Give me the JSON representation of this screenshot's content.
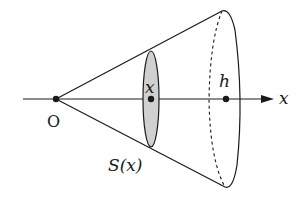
{
  "diagram": {
    "labels": {
      "origin": "O",
      "cross_section_position": "x",
      "height": "h",
      "axis": "x",
      "area": "S(x)"
    },
    "colors": {
      "stroke": "#1a1a1a",
      "cross_section_fill": "#d0d0d0",
      "background": "#ffffff"
    }
  }
}
